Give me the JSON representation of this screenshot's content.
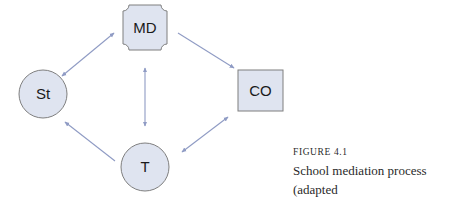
{
  "diagram": {
    "colors": {
      "node_fill": "#dfe4f0",
      "node_stroke": "#7f7f7f",
      "arrow": "#8f9bc4"
    },
    "nodes": {
      "md": {
        "label": "MD",
        "shape": "plaque"
      },
      "st": {
        "label": "St",
        "shape": "circle"
      },
      "co": {
        "label": "CO",
        "shape": "square"
      },
      "t": {
        "label": "T",
        "shape": "circle"
      }
    },
    "edges": [
      {
        "from": "St",
        "to": "MD",
        "direction": "both"
      },
      {
        "from": "MD",
        "to": "CO",
        "direction": "forward"
      },
      {
        "from": "MD",
        "to": "T",
        "direction": "both"
      },
      {
        "from": "T",
        "to": "CO",
        "direction": "both"
      },
      {
        "from": "T",
        "to": "St",
        "direction": "forward"
      }
    ]
  },
  "caption": {
    "figure_label": "FIGURE 4.1",
    "line1": "School mediation process (adapted",
    "line2": "from Damiano, 2013, p. 76)"
  }
}
